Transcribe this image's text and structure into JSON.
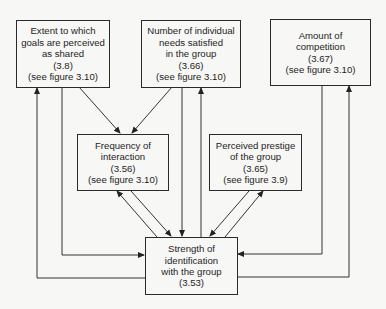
{
  "diagram": {
    "nodes": {
      "goals_shared": {
        "lines": [
          "Extent to which",
          "goals are perceived",
          "as shared",
          "(3.8)",
          "(see figure 3.10)"
        ]
      },
      "needs_satisfied": {
        "lines": [
          "Number of individual",
          "needs satisfied",
          "in the group",
          "(3.66)",
          "(see figure 3.10)"
        ]
      },
      "competition": {
        "lines": [
          "Amount of",
          "competition",
          "(3.67)",
          "(see figure 3.10)"
        ]
      },
      "interaction": {
        "lines": [
          "Frequency of",
          "interaction",
          "(3.56)",
          "(see figure 3.10)"
        ]
      },
      "prestige": {
        "lines": [
          "Perceived prestige",
          "of the group",
          "(3.65)",
          "(see figure 3.9)"
        ]
      },
      "identification": {
        "lines": [
          "Strength of",
          "identification",
          "with the group",
          "(3.53)"
        ]
      }
    },
    "edges": [
      {
        "from": "goals_shared",
        "to": "interaction"
      },
      {
        "from": "needs_satisfied",
        "to": "interaction"
      },
      {
        "from": "goals_shared",
        "to": "identification"
      },
      {
        "from": "identification",
        "to": "goals_shared"
      },
      {
        "from": "needs_satisfied",
        "to": "identification"
      },
      {
        "from": "identification",
        "to": "needs_satisfied"
      },
      {
        "from": "competition",
        "to": "identification"
      },
      {
        "from": "identification",
        "to": "competition"
      },
      {
        "from": "interaction",
        "to": "identification"
      },
      {
        "from": "identification",
        "to": "interaction"
      },
      {
        "from": "prestige",
        "to": "identification"
      },
      {
        "from": "identification",
        "to": "prestige"
      }
    ]
  }
}
